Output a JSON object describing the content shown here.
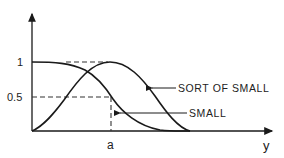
{
  "diagram": {
    "title": "",
    "y_tick_one": "1",
    "y_tick_half": "0.5",
    "x_tick_a": "a",
    "x_axis_label": "y",
    "curves": [
      {
        "name": "SMALL",
        "label": "SMALL",
        "description": "decreasing membership: 1 at origin, 0.5 at a, 0 at end"
      },
      {
        "name": "SORT OF SMALL",
        "label": "SORT OF SMALL",
        "description": "rises from 0 to peak 1 at a, then falls to 0"
      }
    ],
    "colors": {
      "ink": "#1a1a1a",
      "background": "#ffffff"
    }
  }
}
